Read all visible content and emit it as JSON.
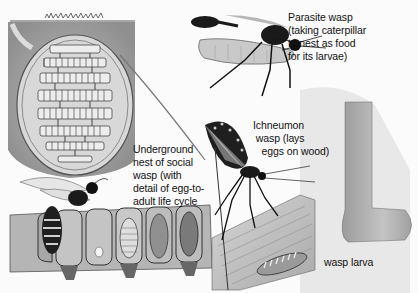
{
  "illustration": {
    "subject": "Wasps",
    "labels": {
      "parasite_wasp": "Parasite wasp\n(taking caterpillar\nto nest as food\nfor its larvae)",
      "underground_nest": "Underground\nnest of social\nwasp (with\ndetail of egg-to-\nadult life cycle",
      "ichneumon_wasp": "Ichneumon\n wasp (lays\n   eggs on wood)",
      "wasp_larva": "wasp larva"
    },
    "elements": [
      "underground-nest-cross-section",
      "nest-comb-cells-life-cycle",
      "social-wasp",
      "parasite-wasp-with-caterpillar",
      "ichneumon-wasp",
      "wood-log",
      "wasp-larva",
      "burrow-tunnel"
    ]
  }
}
